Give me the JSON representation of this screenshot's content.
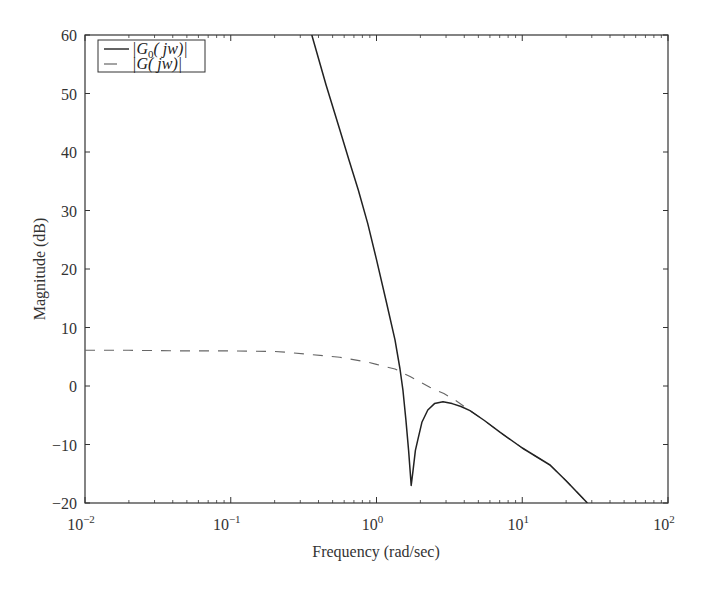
{
  "chart_data": {
    "type": "line",
    "title": "",
    "xlabel": "Frequency (rad/sec)",
    "ylabel": "Magnitude (dB)",
    "xscale": "log",
    "xlim": [
      0.01,
      100
    ],
    "ylim": [
      -20,
      60
    ],
    "grid": false,
    "legend_position": "upper-left",
    "x_ticks": [
      {
        "value": 0.01,
        "base": "10",
        "exp": "−2"
      },
      {
        "value": 0.1,
        "base": "10",
        "exp": "−1"
      },
      {
        "value": 1,
        "base": "10",
        "exp": "0"
      },
      {
        "value": 10,
        "base": "10",
        "exp": "1"
      },
      {
        "value": 100,
        "base": "10",
        "exp": "2"
      }
    ],
    "y_ticks": [
      {
        "value": 60,
        "label": "60"
      },
      {
        "value": 50,
        "label": "50"
      },
      {
        "value": 40,
        "label": "40"
      },
      {
        "value": 30,
        "label": "30"
      },
      {
        "value": 20,
        "label": "20"
      },
      {
        "value": 10,
        "label": "10"
      },
      {
        "value": 0,
        "label": "0"
      },
      {
        "value": -10,
        "label": "−10"
      },
      {
        "value": -20,
        "label": "−20"
      }
    ],
    "series": [
      {
        "name": "|G0(jw)|",
        "legend_main": "|G",
        "legend_sub": "0",
        "legend_rest": "( jw)|",
        "style": "solid",
        "color": "#222222",
        "x": [
          0.36,
          0.45,
          0.56,
          0.65,
          0.75,
          0.87,
          1.0,
          1.16,
          1.34,
          1.45,
          1.52,
          1.59,
          1.66,
          1.73,
          1.78,
          1.85,
          1.92,
          2.05,
          2.25,
          2.5,
          2.86,
          3.3,
          3.8,
          4.38,
          5.5,
          7.03,
          10.0,
          15.5,
          20.0,
          28.0
        ],
        "y": [
          60,
          51.5,
          43.8,
          38.5,
          33.5,
          27.8,
          21.6,
          14.7,
          7.9,
          2.9,
          -0.8,
          -5.8,
          -11.0,
          -17.0,
          -14.5,
          -11.0,
          -9.2,
          -6.2,
          -4.1,
          -3.0,
          -2.7,
          -3.0,
          -3.5,
          -4.2,
          -5.9,
          -7.9,
          -10.6,
          -13.5,
          -16.2,
          -20.0
        ]
      },
      {
        "name": "|G(jw)|",
        "legend_main": "|G",
        "legend_sub": "",
        "legend_rest": "( jw)|",
        "style": "dashed",
        "color": "#666666",
        "x": [
          0.01,
          0.02,
          0.05,
          0.1,
          0.2,
          0.235,
          0.35,
          0.56,
          0.86,
          1.0,
          1.34,
          1.7,
          2.32,
          2.9,
          3.45,
          4.38,
          5.5,
          7.03,
          10.0,
          15.5,
          20.0,
          28.0
        ],
        "y": [
          6.1,
          6.1,
          6.0,
          6.0,
          5.9,
          5.8,
          5.4,
          4.9,
          4.1,
          3.7,
          2.9,
          1.6,
          -0.2,
          -1.3,
          -2.4,
          -4.2,
          -5.9,
          -7.9,
          -10.6,
          -13.5,
          -16.2,
          -20.0
        ]
      }
    ]
  },
  "labels": {
    "xlabel": "Frequency (rad/sec)",
    "ylabel": "Magnitude (dB)"
  }
}
